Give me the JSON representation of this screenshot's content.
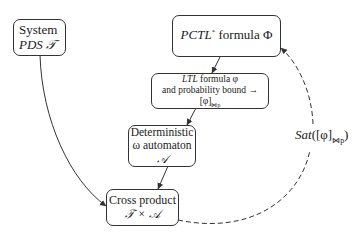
{
  "nodes": {
    "system": {
      "line1": "System",
      "line2_prefix": "PDS ",
      "line2_sym": "𝒯"
    },
    "pctl": {
      "prefix": "PCTL",
      "sup": "*",
      "rest": " formula Φ"
    },
    "ltl": {
      "line1_it": "LTL",
      "line1_rest": " formula φ",
      "line2": "and probability bound → [φ]",
      "line2_sub": "⋈p"
    },
    "deterministic": {
      "line1": "Deterministic",
      "line2_prefix": "ω automaton ",
      "line2_sym": "𝒜"
    },
    "cross": {
      "line1": "Cross product",
      "line2": "𝒯 × 𝒜"
    }
  },
  "edge_label": {
    "prefix": "Sat",
    "body": "([φ]",
    "sub": "⋈p",
    "close": ")"
  },
  "edges": [
    {
      "from": "system",
      "to": "cross",
      "style": "solid"
    },
    {
      "from": "pctl",
      "to": "ltl",
      "style": "solid"
    },
    {
      "from": "ltl",
      "to": "deterministic",
      "style": "solid"
    },
    {
      "from": "deterministic",
      "to": "cross",
      "style": "solid"
    },
    {
      "from": "cross",
      "to": "pctl",
      "style": "dashed",
      "label": "Sat([φ]⋈p)"
    }
  ]
}
